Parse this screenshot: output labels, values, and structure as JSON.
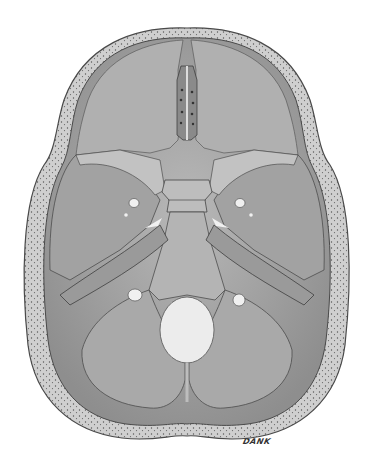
{
  "illustration": {
    "subject": "cranial-base-superior-view",
    "signature": "DANK",
    "colors": {
      "background": "#ffffff",
      "bone_fill": "#a8a8a8",
      "bone_light": "#c4c4c4",
      "bone_dark": "#7c7c7c",
      "outline": "#4a4a4a",
      "foramen": "#ececec",
      "diploe_dots": "#555555"
    }
  }
}
